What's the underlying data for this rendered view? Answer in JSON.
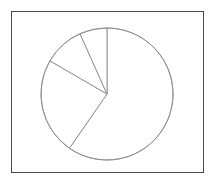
{
  "figure": {
    "background_color": "#ffffff",
    "frame": {
      "border_color": "#4a4a4a",
      "fill_color": "#ffffff",
      "x": 11,
      "y": 11,
      "width": 193,
      "height": 162
    }
  },
  "chart_data": {
    "type": "pie",
    "title": "",
    "xlabel": "",
    "ylabel": "",
    "legend": "none",
    "grid": false,
    "line_color": "#8c8c8c",
    "slice_fill_color": "#ffffff",
    "center": {
      "x": 107,
      "y": 94
    },
    "radius": 66,
    "start_angle_deg": 90,
    "direction": "clockwise",
    "categories": [
      "Slice 1",
      "Slice 2",
      "Slice 3",
      "Slice 4"
    ],
    "values": [
      59.6,
      23.8,
      9.9,
      6.7
    ],
    "angles_deg": [
      214.7,
      85.5,
      35.7,
      24.1
    ],
    "boundary_angles_deg": [
      0,
      214.7,
      300.2,
      335.9,
      360
    ],
    "slices": [
      {
        "label": "Slice 1",
        "value": 59.6,
        "angle_deg": 214.7,
        "start_deg": 0,
        "end_deg": 214.7
      },
      {
        "label": "Slice 2",
        "value": 23.8,
        "angle_deg": 85.5,
        "start_deg": 214.7,
        "end_deg": 300.2
      },
      {
        "label": "Slice 3",
        "value": 9.9,
        "angle_deg": 35.7,
        "start_deg": 300.2,
        "end_deg": 335.9
      },
      {
        "label": "Slice 4",
        "value": 6.7,
        "angle_deg": 24.1,
        "start_deg": 335.9,
        "end_deg": 360
      }
    ]
  }
}
